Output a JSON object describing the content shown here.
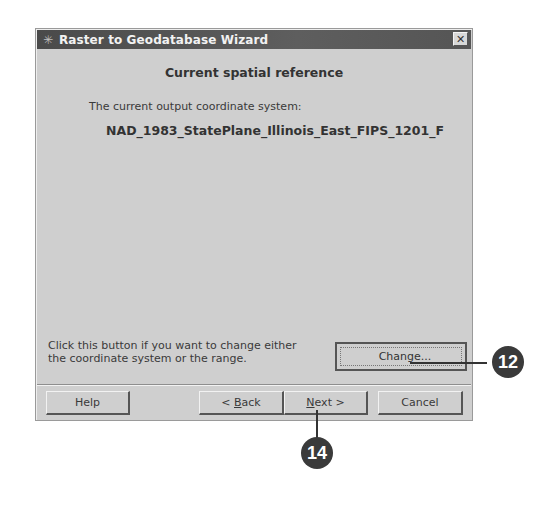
{
  "window": {
    "title": "Raster to Geodatabase Wizard",
    "icon": "wizard-icon",
    "close_label": "✕"
  },
  "page": {
    "heading": "Current spatial reference",
    "coord_label": "The current output coordinate system:",
    "coord_value": "NAD_1983_StatePlane_Illinois_East_FIPS_1201_F",
    "hint_line1": "Click this button if you want to change either",
    "hint_line2": "the coordinate system or the range.",
    "change_label": "Change..."
  },
  "buttons": {
    "help": "Help",
    "back_prefix": "< ",
    "back_accel": "B",
    "back_rest": "ack",
    "next_accel": "N",
    "next_rest": "ext >",
    "cancel": "Cancel"
  },
  "callouts": {
    "change": "12",
    "next": "14"
  }
}
